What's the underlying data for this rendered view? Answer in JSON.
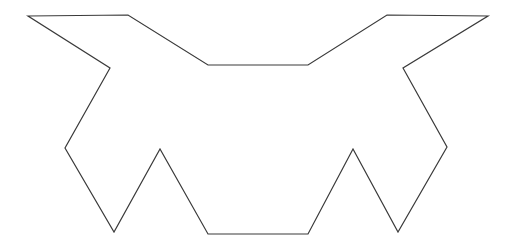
{
  "canvas": {
    "width": 516,
    "height": 251,
    "background_color": "#ffffff"
  },
  "figure": {
    "name": "bat-silhouette-outline",
    "stroke_color": "#3a3a3a",
    "fill_color": "none",
    "stroke_width": 1.2,
    "closed": true,
    "symmetry": "bilateral-vertical",
    "vertex_count": 18,
    "points": "28,16 128,15 208,65 308,65 387,15 488,16 403,68 447,147 398,232 353,149 308,234 208,234 160,149 114,232 65,148 110,68",
    "points_list": [
      [
        28,
        16
      ],
      [
        128,
        15
      ],
      [
        208,
        65
      ],
      [
        308,
        65
      ],
      [
        387,
        15
      ],
      [
        488,
        16
      ],
      [
        403,
        68
      ],
      [
        447,
        147
      ],
      [
        398,
        232
      ],
      [
        353,
        149
      ],
      [
        308,
        234
      ],
      [
        208,
        234
      ],
      [
        160,
        149
      ],
      [
        114,
        232
      ],
      [
        65,
        148
      ],
      [
        110,
        68
      ]
    ]
  }
}
